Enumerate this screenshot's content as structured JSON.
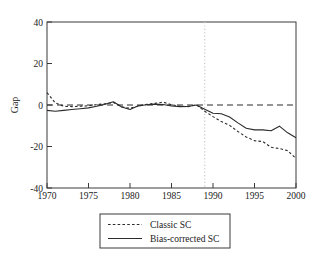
{
  "chart_data": {
    "type": "line",
    "title": "",
    "xlabel": "",
    "ylabel": "Gap",
    "xlim": [
      1970,
      2000
    ],
    "ylim": [
      -40,
      40
    ],
    "xticks": [
      "1970",
      "1975",
      "1980",
      "1985",
      "1990",
      "1995",
      "2000"
    ],
    "yticks": [
      "40",
      "20",
      "0",
      "-20",
      "-40"
    ],
    "grid": false,
    "legend_position": "below-axes",
    "annotations": {
      "vertical_marker_year": 1989,
      "zero_reference_line": 0
    },
    "x": [
      1970,
      1971,
      1972,
      1973,
      1974,
      1975,
      1976,
      1977,
      1978,
      1979,
      1980,
      1981,
      1982,
      1983,
      1984,
      1985,
      1986,
      1987,
      1988,
      1989,
      1990,
      1991,
      1992,
      1993,
      1994,
      1995,
      1996,
      1997,
      1998,
      1999,
      2000
    ],
    "series": [
      {
        "name": "Classic SC",
        "style": "dotted",
        "color": "#2b2b2b",
        "values": [
          6.0,
          1.0,
          -0.6,
          -0.8,
          -0.6,
          -0.4,
          0.2,
          0.6,
          1.2,
          -0.9,
          -1.6,
          -0.5,
          0.3,
          0.8,
          1.4,
          0.1,
          -0.6,
          -0.8,
          0.1,
          -3.0,
          -5.6,
          -8.0,
          -9.8,
          -12.8,
          -15.4,
          -17.2,
          -17.6,
          -20.4,
          -21.0,
          -22.0,
          -25.8
        ]
      },
      {
        "name": "Bias-corrected SC",
        "style": "solid",
        "color": "#2b2b2b",
        "values": [
          -2.6,
          -3.0,
          -2.6,
          -2.2,
          -1.8,
          -1.4,
          -0.6,
          0.4,
          1.6,
          -1.0,
          -2.2,
          -0.4,
          0.1,
          0.4,
          0.2,
          -0.5,
          -0.8,
          -0.7,
          0.0,
          -2.0,
          -4.0,
          -4.2,
          -5.8,
          -8.6,
          -11.2,
          -12.0,
          -12.0,
          -12.4,
          -10.2,
          -13.4,
          -15.8
        ]
      }
    ],
    "legend": [
      {
        "label": "Classic SC",
        "style": "dotted"
      },
      {
        "label": "Bias-corrected SC",
        "style": "solid"
      }
    ]
  },
  "footer": {
    "cut_text": ""
  }
}
